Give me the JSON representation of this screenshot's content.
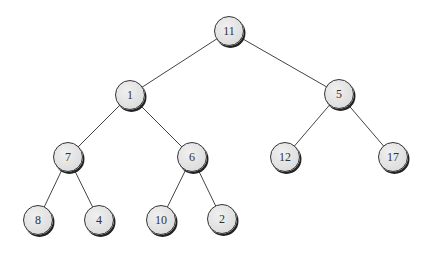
{
  "diagram": {
    "type": "binary-tree",
    "nodes": [
      {
        "id": "n11",
        "label": "11",
        "x": 229,
        "y": 31
      },
      {
        "id": "n1",
        "label": "1",
        "x": 130,
        "y": 95
      },
      {
        "id": "n5",
        "label": "5",
        "x": 339,
        "y": 94
      },
      {
        "id": "n7",
        "label": "7",
        "x": 68,
        "y": 157
      },
      {
        "id": "n6",
        "label": "6",
        "x": 192,
        "y": 157
      },
      {
        "id": "n12",
        "label": "12",
        "x": 285,
        "y": 157
      },
      {
        "id": "n17",
        "label": "17",
        "x": 393,
        "y": 157
      },
      {
        "id": "n8",
        "label": "8",
        "x": 38,
        "y": 220
      },
      {
        "id": "n4",
        "label": "4",
        "x": 99,
        "y": 220
      },
      {
        "id": "n10",
        "label": "10",
        "x": 161,
        "y": 220
      },
      {
        "id": "n2",
        "label": "2",
        "x": 222,
        "y": 219
      }
    ],
    "edges": [
      [
        "n11",
        "n1"
      ],
      [
        "n11",
        "n5"
      ],
      [
        "n1",
        "n7"
      ],
      [
        "n1",
        "n6"
      ],
      [
        "n5",
        "n12"
      ],
      [
        "n5",
        "n17"
      ],
      [
        "n7",
        "n8"
      ],
      [
        "n7",
        "n4"
      ],
      [
        "n6",
        "n10"
      ],
      [
        "n6",
        "n2"
      ]
    ],
    "colors": {
      "node_fill": "#e0e0e0",
      "node_border": "#333333",
      "edge": "#444444",
      "text": "#333333"
    }
  }
}
